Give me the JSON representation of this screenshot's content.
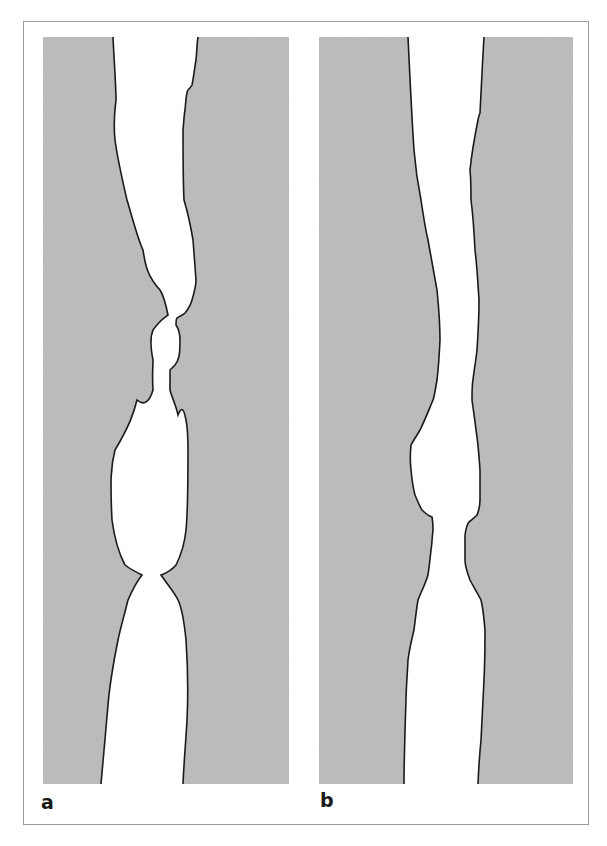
{
  "figure": {
    "colors": {
      "tissue_fill": "#b4b4b4",
      "outline": "#1a1a1a",
      "lumen": "#ffffff",
      "frame": "#9a9a9a"
    },
    "panels": [
      {
        "label": "a",
        "description": "Channel with irregular, segmented lumen showing constrictions"
      },
      {
        "label": "b",
        "description": "Channel with smoother, more uniform lumen"
      }
    ]
  }
}
